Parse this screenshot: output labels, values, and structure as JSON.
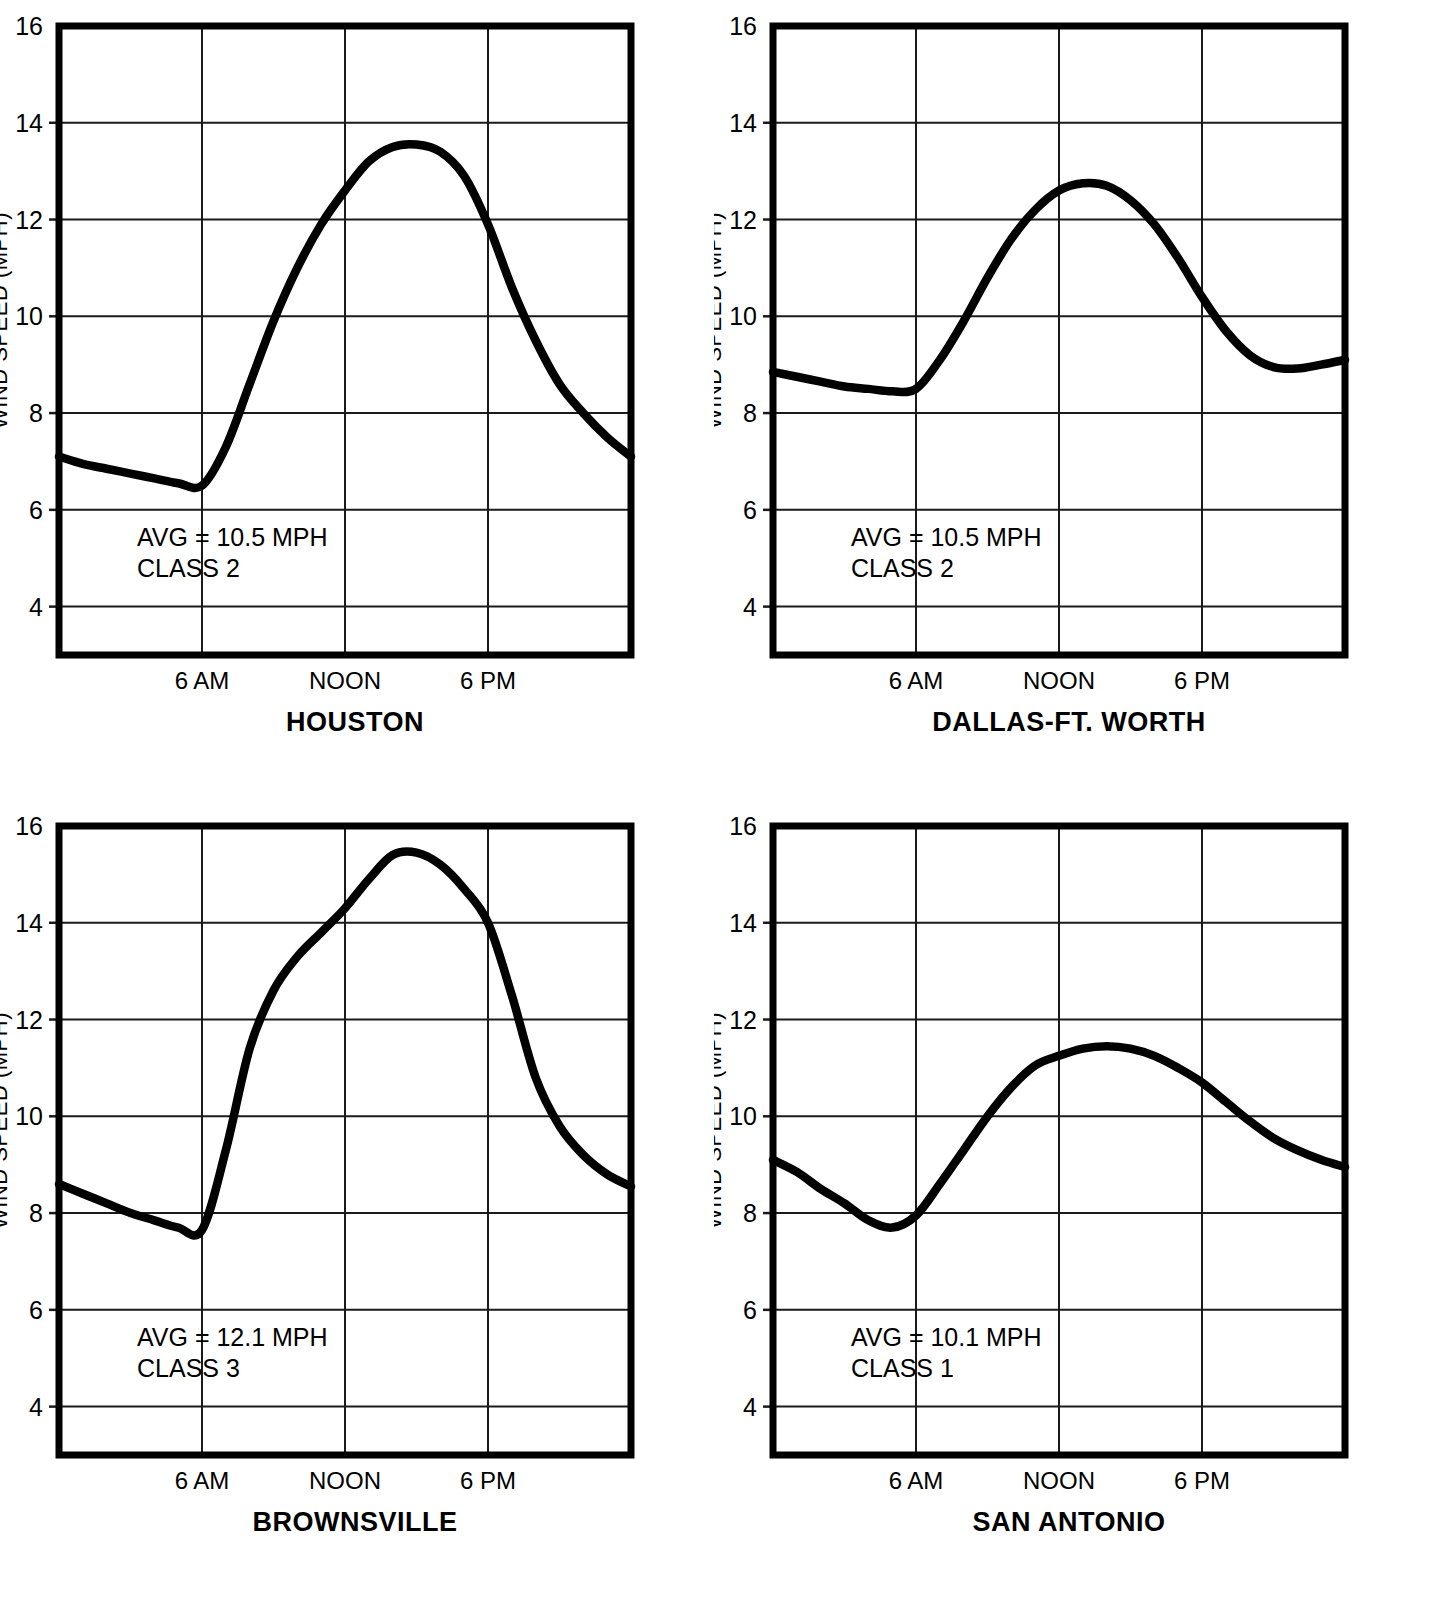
{
  "figure": {
    "axis_label_y": "WIND SPEED (MPH)",
    "y_ticks": [
      "16",
      "14",
      "12",
      "10",
      "8",
      "6",
      "4"
    ],
    "x_ticks": [
      "6 AM",
      "NOON",
      "6 PM"
    ]
  },
  "panels": [
    {
      "city": "HOUSTON",
      "avg_text": "AVG = 10.5 MPH",
      "class_text": "CLASS 2",
      "ylabel": "WIND SPEED (MPH)",
      "yticks": [
        "16",
        "14",
        "12",
        "10",
        "8",
        "6",
        "4"
      ],
      "xticks": [
        "6 AM",
        "NOON",
        "6 PM"
      ]
    },
    {
      "city": "DALLAS-FT. WORTH",
      "avg_text": "AVG = 10.5 MPH",
      "class_text": "CLASS 2",
      "ylabel": "WIND SPEED (MPH)",
      "yticks": [
        "16",
        "14",
        "12",
        "10",
        "8",
        "6",
        "4"
      ],
      "xticks": [
        "6 AM",
        "NOON",
        "6 PM"
      ]
    },
    {
      "city": "BROWNSVILLE",
      "avg_text": "AVG = 12.1 MPH",
      "class_text": "CLASS 3",
      "ylabel": "WIND SPEED (MPH)",
      "yticks": [
        "16",
        "14",
        "12",
        "10",
        "8",
        "6",
        "4"
      ],
      "xticks": [
        "6 AM",
        "NOON",
        "6 PM"
      ]
    },
    {
      "city": "SAN ANTONIO",
      "avg_text": "AVG = 10.1 MPH",
      "class_text": "CLASS 1",
      "ylabel": "WIND SPEED (MPH)",
      "yticks": [
        "16",
        "14",
        "12",
        "10",
        "8",
        "6",
        "4"
      ],
      "xticks": [
        "6 AM",
        "NOON",
        "6 PM"
      ]
    }
  ],
  "chart_data": [
    {
      "type": "line",
      "title": "HOUSTON",
      "xlabel": "",
      "ylabel": "WIND SPEED (MPH)",
      "ylim": [
        3.0,
        16
      ],
      "xlim": [
        0,
        24
      ],
      "grid": true,
      "legend": "none",
      "xtick_values": [
        6,
        12,
        18
      ],
      "xtick_labels": [
        "6 AM",
        "NOON",
        "6 PM"
      ],
      "ytick_values": [
        4,
        6,
        8,
        10,
        12,
        14,
        16
      ],
      "annotations": [
        "AVG = 10.5 MPH",
        "CLASS 2"
      ],
      "x": [
        0,
        1,
        2,
        3,
        4,
        5,
        6,
        7,
        8,
        9,
        10,
        11,
        12,
        13,
        14,
        15,
        16,
        17,
        18,
        19,
        20,
        21,
        22,
        23,
        24
      ],
      "y": [
        7.1,
        6.95,
        6.85,
        6.75,
        6.65,
        6.55,
        6.5,
        7.3,
        8.6,
        9.9,
        11.0,
        11.9,
        12.6,
        13.2,
        13.5,
        13.55,
        13.4,
        12.9,
        11.9,
        10.6,
        9.5,
        8.6,
        8.0,
        7.5,
        7.1
      ],
      "avg": 10.5,
      "wind_class": 2
    },
    {
      "type": "line",
      "title": "DALLAS-FT. WORTH",
      "xlabel": "",
      "ylabel": "WIND SPEED (MPH)",
      "ylim": [
        3.0,
        16
      ],
      "xlim": [
        0,
        24
      ],
      "grid": true,
      "legend": "none",
      "xtick_values": [
        6,
        12,
        18
      ],
      "xtick_labels": [
        "6 AM",
        "NOON",
        "6 PM"
      ],
      "ytick_values": [
        4,
        6,
        8,
        10,
        12,
        14,
        16
      ],
      "annotations": [
        "AVG = 10.5 MPH",
        "CLASS 2"
      ],
      "x": [
        0,
        1,
        2,
        3,
        4,
        5,
        6,
        7,
        8,
        9,
        10,
        11,
        12,
        13,
        14,
        15,
        16,
        17,
        18,
        19,
        20,
        21,
        22,
        23,
        24
      ],
      "y": [
        8.85,
        8.75,
        8.65,
        8.55,
        8.5,
        8.45,
        8.5,
        9.1,
        9.9,
        10.8,
        11.6,
        12.2,
        12.6,
        12.75,
        12.7,
        12.4,
        11.9,
        11.2,
        10.4,
        9.7,
        9.2,
        8.95,
        8.92,
        9.0,
        9.1
      ],
      "avg": 10.5,
      "wind_class": 2
    },
    {
      "type": "line",
      "title": "BROWNSVILLE",
      "xlabel": "",
      "ylabel": "WIND SPEED (MPH)",
      "ylim": [
        3.0,
        16
      ],
      "xlim": [
        0,
        24
      ],
      "grid": true,
      "legend": "none",
      "xtick_values": [
        6,
        12,
        18
      ],
      "xtick_labels": [
        "6 AM",
        "NOON",
        "6 PM"
      ],
      "ytick_values": [
        4,
        6,
        8,
        10,
        12,
        14,
        16
      ],
      "annotations": [
        "AVG = 12.1 MPH",
        "CLASS 3"
      ],
      "x": [
        0,
        1,
        2,
        3,
        4,
        5,
        6,
        7,
        8,
        9,
        10,
        11,
        12,
        13,
        14,
        15,
        16,
        17,
        18,
        19,
        20,
        21,
        22,
        23,
        24
      ],
      "y": [
        8.6,
        8.4,
        8.2,
        8.0,
        7.85,
        7.7,
        7.65,
        9.3,
        11.4,
        12.6,
        13.3,
        13.8,
        14.3,
        14.9,
        15.4,
        15.45,
        15.2,
        14.7,
        14.0,
        12.5,
        10.8,
        9.8,
        9.2,
        8.8,
        8.55
      ],
      "avg": 12.1,
      "wind_class": 3
    },
    {
      "type": "line",
      "title": "SAN ANTONIO",
      "xlabel": "",
      "ylabel": "WIND SPEED (MPH)",
      "ylim": [
        3.0,
        16
      ],
      "xlim": [
        0,
        24
      ],
      "grid": true,
      "legend": "none",
      "xtick_values": [
        6,
        12,
        18
      ],
      "xtick_labels": [
        "6 AM",
        "NOON",
        "6 PM"
      ],
      "ytick_values": [
        4,
        6,
        8,
        10,
        12,
        14,
        16
      ],
      "annotations": [
        "AVG = 10.1 MPH",
        "CLASS 1"
      ],
      "x": [
        0,
        1,
        2,
        3,
        4,
        5,
        6,
        7,
        8,
        9,
        10,
        11,
        12,
        13,
        14,
        15,
        16,
        17,
        18,
        19,
        20,
        21,
        22,
        23,
        24
      ],
      "y": [
        9.1,
        8.85,
        8.5,
        8.2,
        7.85,
        7.7,
        7.95,
        8.6,
        9.3,
        10.0,
        10.6,
        11.05,
        11.25,
        11.4,
        11.45,
        11.4,
        11.25,
        11.0,
        10.7,
        10.3,
        9.9,
        9.55,
        9.3,
        9.1,
        8.95
      ],
      "avg": 10.1,
      "wind_class": 1
    }
  ]
}
